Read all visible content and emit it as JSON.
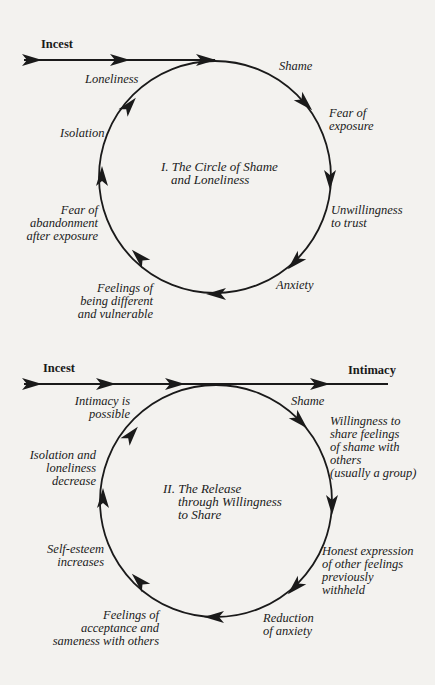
{
  "diagram1": {
    "start_label": "Incest",
    "title_line1": "I. The Circle of Shame",
    "title_line2": "and Loneliness",
    "nodes": [
      {
        "lines": [
          "Shame"
        ]
      },
      {
        "lines": [
          "Fear of",
          "exposure"
        ]
      },
      {
        "lines": [
          "Unwillingness",
          "to trust"
        ]
      },
      {
        "lines": [
          "Anxiety"
        ]
      },
      {
        "lines": [
          "Feelings of",
          "being different",
          "and vulnerable"
        ]
      },
      {
        "lines": [
          "Fear of",
          "abandonment",
          "after exposure"
        ]
      },
      {
        "lines": [
          "Isolation"
        ]
      },
      {
        "lines": [
          "Loneliness"
        ]
      }
    ]
  },
  "diagram2": {
    "start_label": "Incest",
    "end_label": "Intimacy",
    "title_line1": "II. The Release",
    "title_line2": "through Willingness",
    "title_line3": "to Share",
    "nodes": [
      {
        "lines": [
          "Shame"
        ]
      },
      {
        "lines": [
          "Willingness to",
          "share feelings",
          "of shame with",
          "others",
          "(usually a group)"
        ]
      },
      {
        "lines": [
          "Honest expression",
          "of other feelings",
          "previously",
          "withheld"
        ]
      },
      {
        "lines": [
          "Reduction",
          "of anxiety"
        ]
      },
      {
        "lines": [
          "Feelings of",
          "acceptance and",
          "sameness with others"
        ]
      },
      {
        "lines": [
          "Self-esteem",
          "increases"
        ]
      },
      {
        "lines": [
          "Isolation and",
          "loneliness",
          "decrease"
        ]
      },
      {
        "lines": [
          "Intimacy is",
          "possible"
        ]
      }
    ]
  },
  "colors": {
    "background": "#f3f2ef",
    "ink": "#1a1a1a"
  }
}
